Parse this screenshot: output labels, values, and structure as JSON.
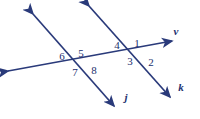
{
  "figure": {
    "width": 200,
    "height": 119,
    "background_color": "#ffffff",
    "stroke_color": "#2a3a7a",
    "label_color": "#22306e"
  },
  "lines": [
    {
      "id": "line-j",
      "label": "j",
      "label_x": 126,
      "label_y": 97,
      "x1": 33,
      "y1": 14,
      "x2": 114,
      "y2": 106,
      "arrow_start": true,
      "arrow_end": true
    },
    {
      "id": "line-k",
      "label": "k",
      "label_x": 181,
      "label_y": 87,
      "x1": 89,
      "y1": 6,
      "x2": 170,
      "y2": 97,
      "arrow_start": true,
      "arrow_end": true
    },
    {
      "id": "line-v",
      "label": "v",
      "label_x": 176,
      "label_y": 31,
      "x1": 8,
      "y1": 71,
      "x2": 172,
      "y2": 41,
      "arrow_start": true,
      "arrow_end": true
    }
  ],
  "intersections": [
    {
      "id": "intersection-left",
      "x": 78,
      "y": 62
    },
    {
      "id": "intersection-right",
      "x": 134,
      "y": 53
    }
  ],
  "angles": [
    {
      "id": "angle-1",
      "label": "1",
      "x": 137,
      "y": 43,
      "intersection": "intersection-right"
    },
    {
      "id": "angle-2",
      "label": "2",
      "x": 151,
      "y": 62,
      "intersection": "intersection-right"
    },
    {
      "id": "angle-3",
      "label": "3",
      "x": 130,
      "y": 61,
      "intersection": "intersection-right"
    },
    {
      "id": "angle-4",
      "label": "4",
      "x": 117,
      "y": 45,
      "intersection": "intersection-right"
    },
    {
      "id": "angle-5",
      "label": "5",
      "x": 81,
      "y": 53,
      "intersection": "intersection-left"
    },
    {
      "id": "angle-6",
      "label": "6",
      "x": 62,
      "y": 56,
      "intersection": "intersection-left"
    },
    {
      "id": "angle-7",
      "label": "7",
      "x": 75,
      "y": 72,
      "intersection": "intersection-left"
    },
    {
      "id": "angle-8",
      "label": "8",
      "x": 94,
      "y": 70,
      "intersection": "intersection-left"
    }
  ]
}
